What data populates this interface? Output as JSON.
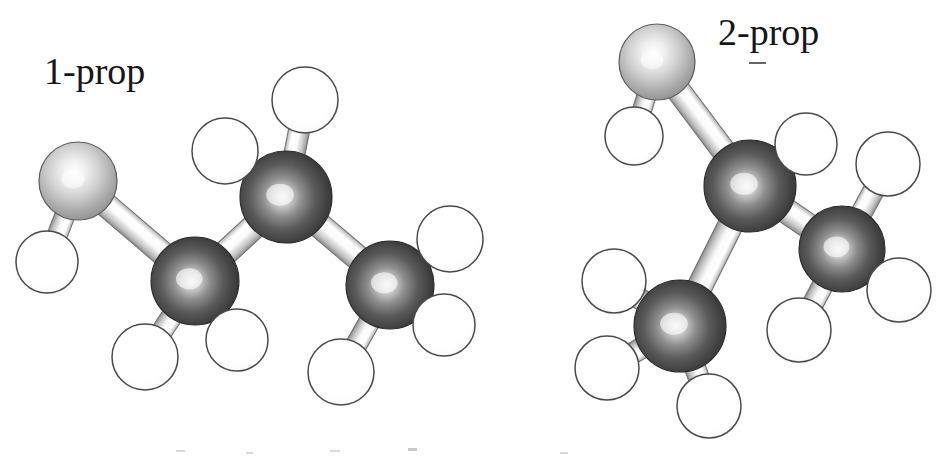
{
  "figure": {
    "background_color": "#ffffff",
    "width": 947,
    "height": 458,
    "style": "ball-and-stick molecular models, grayscale halftone scan"
  },
  "labels": [
    {
      "id": "label-1prop",
      "text": "1-prop",
      "x": 44,
      "y": 52
    },
    {
      "id": "label-2prop",
      "text": "2-prop",
      "x": 718,
      "y": 13
    }
  ],
  "palette": {
    "carbon_dark": "#3c3c3c",
    "carbon_mid": "#6e6e6e",
    "carbon_highlight": "#efefef",
    "oxygen_gray": "#a9a9a9",
    "oxygen_highlight": "#ffffff",
    "oxygen_outline": "#5c5c5c",
    "hydrogen_white": "#ffffff",
    "hydrogen_outline": "#4a4a4a",
    "bond_light": "#fdfdfd",
    "bond_shade": "#9b9b9b",
    "bond_outline": "#6b6b6b",
    "text_color": "#161616"
  },
  "molecules": [
    {
      "name": "1-propanol",
      "label": "1-prop",
      "atoms": [
        {
          "id": "O1",
          "element": "O",
          "cx": 78,
          "cy": 181,
          "r": 39
        },
        {
          "id": "HO1",
          "element": "H",
          "cx": 47,
          "cy": 262,
          "r": 31
        },
        {
          "id": "C1",
          "element": "C",
          "cx": 195,
          "cy": 281,
          "r": 44
        },
        {
          "id": "H1a",
          "element": "H",
          "cx": 145,
          "cy": 357,
          "r": 33
        },
        {
          "id": "H1b",
          "element": "H",
          "cx": 237,
          "cy": 340,
          "r": 31
        },
        {
          "id": "C2",
          "element": "C",
          "cx": 286,
          "cy": 197,
          "r": 46
        },
        {
          "id": "H2a",
          "element": "H",
          "cx": 225,
          "cy": 151,
          "r": 33
        },
        {
          "id": "H2b",
          "element": "H",
          "cx": 305,
          "cy": 100,
          "r": 33
        },
        {
          "id": "C3",
          "element": "C",
          "cx": 390,
          "cy": 285,
          "r": 44
        },
        {
          "id": "H3a",
          "element": "H",
          "cx": 450,
          "cy": 239,
          "r": 33
        },
        {
          "id": "H3b",
          "element": "H",
          "cx": 444,
          "cy": 325,
          "r": 31
        },
        {
          "id": "H3c",
          "element": "H",
          "cx": 341,
          "cy": 372,
          "r": 33
        }
      ],
      "bonds": [
        {
          "from": "O1",
          "to": "HO1",
          "width": 20
        },
        {
          "from": "O1",
          "to": "C1",
          "width": 24
        },
        {
          "from": "C1",
          "to": "H1a",
          "width": 21
        },
        {
          "from": "C1",
          "to": "H1b",
          "width": 21
        },
        {
          "from": "C1",
          "to": "C2",
          "width": 25
        },
        {
          "from": "C2",
          "to": "H2a",
          "width": 21
        },
        {
          "from": "C2",
          "to": "H2b",
          "width": 21
        },
        {
          "from": "C2",
          "to": "C3",
          "width": 25
        },
        {
          "from": "C3",
          "to": "H3a",
          "width": 21
        },
        {
          "from": "C3",
          "to": "H3b",
          "width": 21
        },
        {
          "from": "C3",
          "to": "H3c",
          "width": 21
        }
      ]
    },
    {
      "name": "2-propanol",
      "label": "2-prop",
      "atoms": [
        {
          "id": "O2",
          "element": "O",
          "cx": 657,
          "cy": 62,
          "r": 38
        },
        {
          "id": "HO2",
          "element": "H",
          "cx": 634,
          "cy": 136,
          "r": 29
        },
        {
          "id": "C2c",
          "element": "C",
          "cx": 750,
          "cy": 186,
          "r": 46
        },
        {
          "id": "H2c",
          "element": "H",
          "cx": 806,
          "cy": 144,
          "r": 31
        },
        {
          "id": "CL",
          "element": "C",
          "cx": 680,
          "cy": 326,
          "r": 46
        },
        {
          "id": "HLa",
          "element": "H",
          "cx": 614,
          "cy": 281,
          "r": 32
        },
        {
          "id": "HLb",
          "element": "H",
          "cx": 607,
          "cy": 368,
          "r": 32
        },
        {
          "id": "HLc",
          "element": "H",
          "cx": 709,
          "cy": 406,
          "r": 32
        },
        {
          "id": "CR",
          "element": "C",
          "cx": 842,
          "cy": 249,
          "r": 43
        },
        {
          "id": "HRa",
          "element": "H",
          "cx": 888,
          "cy": 164,
          "r": 32
        },
        {
          "id": "HRb",
          "element": "H",
          "cx": 899,
          "cy": 290,
          "r": 32
        },
        {
          "id": "HRc",
          "element": "H",
          "cx": 799,
          "cy": 330,
          "r": 32
        }
      ],
      "bonds": [
        {
          "from": "O2",
          "to": "HO2",
          "width": 19
        },
        {
          "from": "O2",
          "to": "C2c",
          "width": 24
        },
        {
          "from": "C2c",
          "to": "H2c",
          "width": 21
        },
        {
          "from": "C2c",
          "to": "CL",
          "width": 25
        },
        {
          "from": "C2c",
          "to": "CR",
          "width": 25
        },
        {
          "from": "CL",
          "to": "HLa",
          "width": 21
        },
        {
          "from": "CL",
          "to": "HLb",
          "width": 21
        },
        {
          "from": "CL",
          "to": "HLc",
          "width": 21
        },
        {
          "from": "CR",
          "to": "HRa",
          "width": 21
        },
        {
          "from": "CR",
          "to": "HRb",
          "width": 21
        },
        {
          "from": "CR",
          "to": "HRc",
          "width": 21
        }
      ]
    }
  ],
  "scan_artifacts": [
    {
      "id": "fleck-a",
      "note": "short dash under 2-prop label"
    },
    {
      "id": "fleck-b",
      "note": "faint clipped text top at page bottom"
    },
    {
      "id": "fleck-c",
      "note": "faint clipped text top at page bottom"
    },
    {
      "id": "fleck-d",
      "note": "faint clipped text top at page bottom"
    },
    {
      "id": "fleck-e",
      "note": "faint clipped text top at page bottom"
    },
    {
      "id": "fleck-f",
      "note": "faint clipped text top at page bottom"
    }
  ]
}
